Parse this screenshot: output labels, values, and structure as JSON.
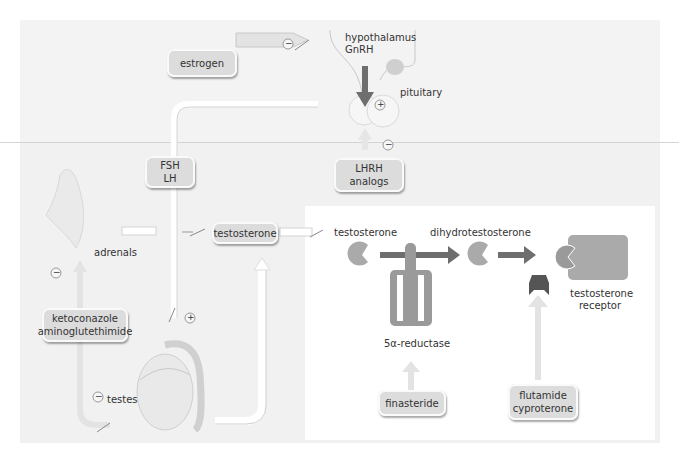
{
  "diagram": {
    "title": "",
    "colors": {
      "background_top": "#f3f3f3",
      "background_bottom": "#f1f1f1",
      "panel": "#ffffff",
      "box_fill": "#dcdcdc",
      "molecule_fill": "#aaaaaa",
      "enzyme_fill": "#9a9a9a",
      "dark_arrow": "#6e6e6e",
      "blocker_fill": "#555555",
      "light_arrow": "#e6e6e6"
    },
    "boxes": {
      "estrogen": "estrogen",
      "fsh": "FSH",
      "lh": "LH",
      "lhrh_line1": "LHRH",
      "lhrh_line2": "analogs",
      "testosterone": "testosterone",
      "keto_line1": "ketoconazole",
      "keto_line2": "aminoglutethimide",
      "finasteride": "finasteride",
      "flutamide_line1": "flutamide",
      "flutamide_line2": "cyproterone"
    },
    "labels": {
      "hypothalamus": "hypothalamus",
      "gnrh": "GnRH",
      "pituitary": "pituitary",
      "adrenals": "adrenals",
      "testes": "testes",
      "testosterone_molecule": "testosterone",
      "dht": "dihydrotestosterone",
      "reductase": "5α-reductase",
      "receptor_line1": "testosterone",
      "receptor_line2": "receptor"
    },
    "signs": {
      "estrogen_effect": "−",
      "gnrh_effect": "+",
      "lhrh_effect": "−",
      "fsh_lh_effect": "+",
      "keto_adrenal_effect": "−",
      "keto_testes_effect": "−"
    },
    "nodes": [
      {
        "id": "hypothalamus",
        "type": "organ"
      },
      {
        "id": "pituitary",
        "type": "organ"
      },
      {
        "id": "adrenals",
        "type": "organ"
      },
      {
        "id": "testes",
        "type": "organ"
      },
      {
        "id": "testosterone",
        "type": "hormone"
      },
      {
        "id": "dihydrotestosterone",
        "type": "hormone"
      },
      {
        "id": "5α-reductase",
        "type": "enzyme"
      },
      {
        "id": "testosterone receptor",
        "type": "receptor"
      }
    ],
    "edges": [
      {
        "from": "estrogen",
        "to": "hypothalamus",
        "sign": "−"
      },
      {
        "from": "hypothalamus",
        "to": "pituitary",
        "label": "GnRH",
        "sign": "+"
      },
      {
        "from": "LHRH analogs",
        "to": "pituitary",
        "sign": "−"
      },
      {
        "from": "pituitary",
        "to": "testes",
        "label": "FSH / LH",
        "sign": "+"
      },
      {
        "from": "adrenals",
        "to": "testosterone"
      },
      {
        "from": "testes",
        "to": "testosterone"
      },
      {
        "from": "ketoconazole / aminoglutethimide",
        "to": "adrenals",
        "sign": "−"
      },
      {
        "from": "ketoconazole / aminoglutethimide",
        "to": "testes",
        "sign": "−"
      },
      {
        "from": "testosterone",
        "to": "dihydrotestosterone",
        "via": "5α-reductase"
      },
      {
        "from": "finasteride",
        "to": "5α-reductase",
        "sign": "inhibits"
      },
      {
        "from": "dihydrotestosterone",
        "to": "testosterone receptor"
      },
      {
        "from": "flutamide / cyproterone",
        "to": "testosterone receptor",
        "sign": "blocks"
      }
    ]
  }
}
